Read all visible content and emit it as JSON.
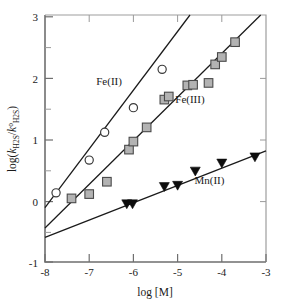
{
  "figure": {
    "background": "#ffffff",
    "plot_frame_color": "#6f6f6f"
  },
  "axes": {
    "x": {
      "label": "log [M]",
      "ticks": [
        "-8",
        "-7",
        "-6",
        "-5",
        "-4",
        "-3"
      ],
      "min": -8,
      "max": -3
    },
    "y": {
      "label_parts": {
        "prefix": "log(",
        "k1": "k",
        "k1_sub": "H",
        "k1_sub2": "2",
        "k1_sub3": "S",
        "slash": "/",
        "k2": "k",
        "k2_sup": "o",
        "k2_sub": "H",
        "k2_sub2": "2",
        "k2_sub3": "S",
        "suffix": ")"
      },
      "label_plain": "log(kH2S/k°H2S)",
      "ticks": [
        "3",
        "2",
        "1",
        "0",
        "-1"
      ],
      "min": -1,
      "max": 3
    }
  },
  "series_labels": {
    "fe2": "Fe(II)",
    "fe3": "Fe(III)",
    "mn2": "Mn(II)"
  },
  "chart_data": {
    "type": "scatter",
    "title": "",
    "xlabel": "log [M]",
    "ylabel": "log(kH2S/k°H2S)",
    "xlim": [
      -8,
      -3
    ],
    "ylim": [
      -1,
      3
    ],
    "grid": false,
    "legend": "inline-annotations",
    "xticks": [
      -8,
      -7,
      -6,
      -5,
      -4,
      -3
    ],
    "yticks": [
      -1,
      0,
      1,
      2,
      3
    ],
    "series": [
      {
        "name": "Fe(II)",
        "marker": "open-circle",
        "marker_fill": "#ffffff",
        "marker_edge": "#3b3b3b",
        "label_position": {
          "x": -6.55,
          "y": 1.86
        },
        "points": [
          {
            "x": -7.75,
            "y": 0.12
          },
          {
            "x": -7.0,
            "y": 0.65
          },
          {
            "x": -6.65,
            "y": 1.1
          },
          {
            "x": -6.0,
            "y": 1.5
          },
          {
            "x": -5.35,
            "y": 2.12
          }
        ],
        "fit": {
          "type": "line",
          "x1": -8.0,
          "y1": -0.12,
          "x2": -4.72,
          "y2": 3.0,
          "slope": 0.95,
          "intercept": 7.48
        }
      },
      {
        "name": "Fe(III)",
        "marker": "filled-square",
        "marker_fill": "#b3b3b3",
        "marker_edge": "#4a4a4a",
        "label_position": {
          "x": -4.72,
          "y": 1.57
        },
        "points": [
          {
            "x": -7.4,
            "y": 0.03
          },
          {
            "x": -7.0,
            "y": 0.1
          },
          {
            "x": -6.6,
            "y": 0.3
          },
          {
            "x": -6.1,
            "y": 0.82
          },
          {
            "x": -6.0,
            "y": 0.95
          },
          {
            "x": -5.7,
            "y": 1.18
          },
          {
            "x": -5.3,
            "y": 1.63
          },
          {
            "x": -5.2,
            "y": 1.68
          },
          {
            "x": -4.78,
            "y": 1.86
          },
          {
            "x": -4.65,
            "y": 1.87
          },
          {
            "x": -4.3,
            "y": 1.9
          },
          {
            "x": -4.15,
            "y": 2.2
          },
          {
            "x": -4.0,
            "y": 2.32
          },
          {
            "x": -3.7,
            "y": 2.56
          }
        ],
        "fit": {
          "type": "line",
          "x1": -8.0,
          "y1": -0.45,
          "x2": -3.12,
          "y2": 3.0,
          "slope": 0.707,
          "intercept": 5.21
        }
      },
      {
        "name": "Mn(II)",
        "marker": "filled-triangle-down",
        "marker_fill": "#0d0d0d",
        "marker_edge": "#0d0d0d",
        "label_position": {
          "x": -4.28,
          "y": 0.26
        },
        "points": [
          {
            "x": -6.15,
            "y": -0.06
          },
          {
            "x": -6.02,
            "y": -0.06
          },
          {
            "x": -5.3,
            "y": 0.22
          },
          {
            "x": -5.0,
            "y": 0.24
          },
          {
            "x": -4.6,
            "y": 0.47
          },
          {
            "x": -4.0,
            "y": 0.6
          },
          {
            "x": -3.25,
            "y": 0.7
          }
        ],
        "fit": {
          "type": "line",
          "x1": -8.0,
          "y1": -0.6,
          "x2": -3.0,
          "y2": 0.8,
          "slope": 0.28,
          "intercept": 1.64
        }
      }
    ]
  }
}
